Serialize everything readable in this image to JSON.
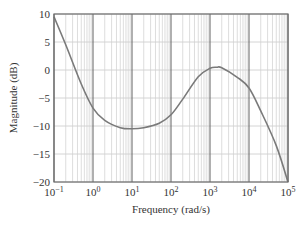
{
  "chart_data": {
    "type": "line",
    "title": "",
    "xlabel": "Frequency (rad/s)",
    "ylabel": "Magnitude (dB)",
    "xscale": "log",
    "xlim": [
      0.1,
      100000
    ],
    "ylim": [
      -20,
      10
    ],
    "x_ticks": [
      {
        "value": 0.1,
        "base": "10",
        "exp": "−1"
      },
      {
        "value": 1,
        "base": "10",
        "exp": "0"
      },
      {
        "value": 10,
        "base": "10",
        "exp": "1"
      },
      {
        "value": 100,
        "base": "10",
        "exp": "2"
      },
      {
        "value": 1000,
        "base": "10",
        "exp": "3"
      },
      {
        "value": 10000,
        "base": "10",
        "exp": "4"
      },
      {
        "value": 100000,
        "base": "10",
        "exp": "5"
      }
    ],
    "y_ticks": [
      10,
      5,
      0,
      -5,
      -10,
      -15,
      -20
    ],
    "y_tick_labels": [
      "10",
      "5",
      "0",
      "−5",
      "−10",
      "−15",
      "−20"
    ],
    "grid": true,
    "legend": null,
    "series": [
      {
        "name": "Magnitude",
        "color": "#7a7a7a",
        "x": [
          0.1,
          0.2,
          0.5,
          1,
          2,
          5,
          10,
          20,
          50,
          100,
          200,
          500,
          1000,
          1500,
          2000,
          5000,
          10000,
          20000,
          50000,
          100000
        ],
        "y": [
          9.5,
          4.5,
          -2.5,
          -6.8,
          -9.0,
          -10.3,
          -10.5,
          -10.3,
          -9.5,
          -8.0,
          -5.2,
          -1.2,
          0.3,
          0.5,
          0.4,
          -1.3,
          -3.2,
          -7.3,
          -13.5,
          -20.0
        ]
      }
    ]
  },
  "colors": {
    "major_grid": "#6e6e6e",
    "minor_grid": "#cfcfcf",
    "frame": "#6e6e6e",
    "curve": "#7a7a7a",
    "text": "#333333"
  }
}
